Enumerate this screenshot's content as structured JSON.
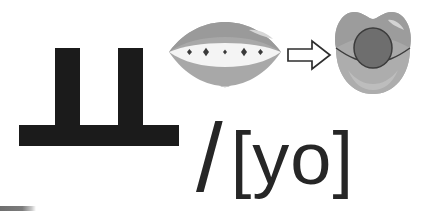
{
  "card": {
    "letter": {
      "name": "hangul-jamo-yo",
      "character": "ㅡ ",
      "display_character": "ㅛ",
      "romanization": "yo",
      "stroke_count": 3,
      "color": "#1b1b1b",
      "strokes": [
        {
          "name": "left-vertical",
          "label": "left vertical stroke"
        },
        {
          "name": "right-vertical",
          "label": "right vertical stroke"
        },
        {
          "name": "baseline",
          "label": "horizontal base stroke"
        }
      ]
    },
    "articulation": {
      "from_label": "spread open mouth",
      "to_label": "rounded mouth",
      "arrow_label": "changes to",
      "lip_color": "#a8a8a8",
      "lip_shade_color": "#949494",
      "lip_highlight_color": "#d2d2d2",
      "inner_mouth_color": "#f2f2f2",
      "aperture_color": "#6a6a6a",
      "outline_color": "#3c3c3c",
      "sparkle_color": "#3a3a3a",
      "sparkle_count": 5
    },
    "phonetic": {
      "slash": "/",
      "transcription": "[yo]",
      "full_text": "/ [yo]",
      "color": "#262626"
    },
    "progress": {
      "label": "page progress",
      "color": "#7c7c7c",
      "value": 36
    }
  }
}
